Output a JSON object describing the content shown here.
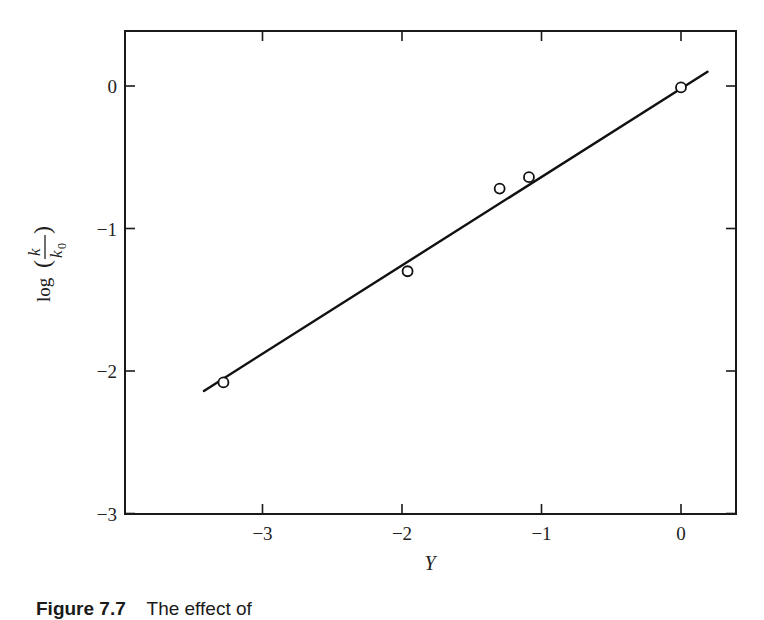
{
  "chart_data": {
    "type": "scatter",
    "title": "",
    "xlabel": "Y",
    "ylabel": "log (k / k0)",
    "ylabel_parts": {
      "prefix": "log",
      "numerator": "k",
      "denominator": "k",
      "denominator_subscript": "0"
    },
    "xlim": [
      -3.9,
      0.4
    ],
    "ylim": [
      -3.0,
      0.38
    ],
    "xticks": [
      -3,
      -2,
      -1,
      0
    ],
    "xtick_labels": [
      "−3",
      "−2",
      "−1",
      "0"
    ],
    "yticks": [
      0,
      -1,
      -2,
      -3
    ],
    "ytick_labels": [
      "0",
      "−1",
      "−2",
      "−3"
    ],
    "grid": false,
    "legend": null,
    "series": [
      {
        "name": "measured",
        "marker": "open-circle",
        "x": [
          -3.28,
          -1.96,
          -1.3,
          -1.09,
          0.0
        ],
        "y": [
          -2.08,
          -1.3,
          -0.72,
          -0.64,
          -0.01
        ]
      },
      {
        "name": "linear fit",
        "style": "solid-line",
        "x": [
          -3.42,
          0.19
        ],
        "y": [
          -2.14,
          0.1
        ]
      }
    ],
    "caption": "Figure 7.7  The effect of"
  },
  "caption": {
    "figure_number": "Figure 7.7",
    "text": "The effect of"
  }
}
